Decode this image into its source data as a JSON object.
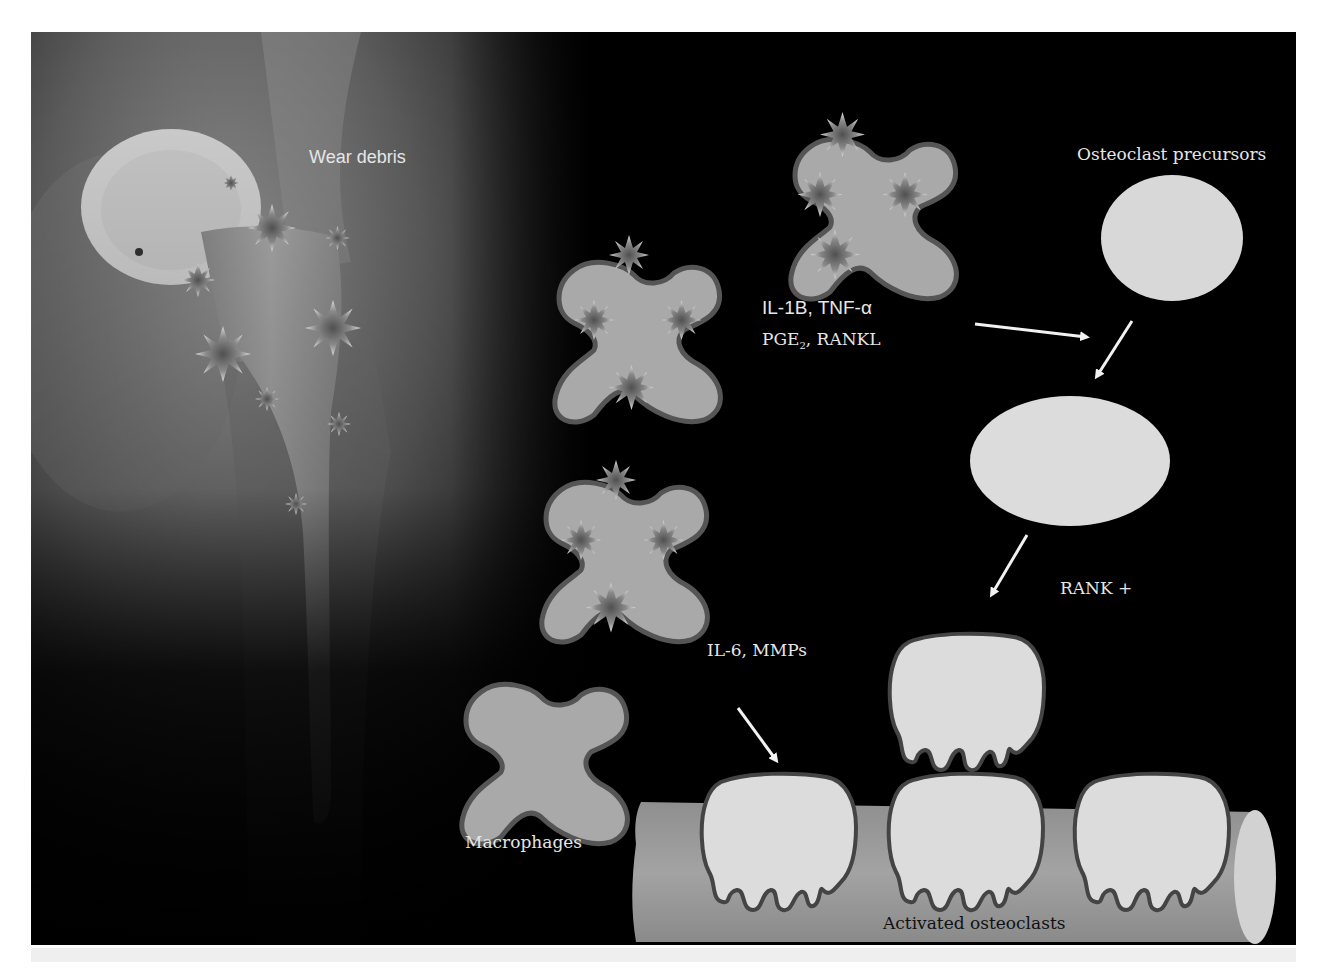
{
  "figure": {
    "labels": {
      "wear_debris": "Wear debris",
      "cytokines_line1": "IL-1B, TNF-α",
      "cytokines_line2_prefix": "PGE",
      "cytokines_line2_sub": "2",
      "cytokines_line2_suffix": ", RANKL",
      "osteoclast_precursors": "Osteoclast precursors",
      "rank_plus": "RANK +",
      "il6_mmps": "IL-6, MMPs",
      "macrophages": "Macrophages",
      "activated_osteoclasts": "Activated osteoclasts"
    },
    "colors": {
      "background": "#000000",
      "cell_fill": "#a9a9a9",
      "cell_outline": "#555555",
      "osteoclast_fill": "#dcdcdc",
      "bone_fill": "#9c9c9c",
      "arrow": "#f2f2f2",
      "text": "#e6e6e6"
    },
    "elements": {
      "macrophages_with_debris": 3,
      "macrophage_plain": 1,
      "precursor_cells": 2,
      "activated_osteoclasts_on_bone": 3,
      "detaching_osteoclast": 1,
      "arrows": 4
    }
  }
}
